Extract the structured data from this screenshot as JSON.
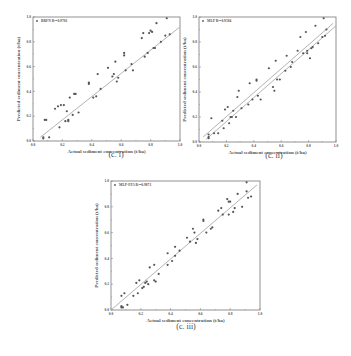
{
  "chart_data": [
    {
      "type": "scatter",
      "id": "c-i",
      "caption": "(c. i)",
      "title": "",
      "xlabel": "Actual sediment concentration (t/ha)",
      "ylabel": "Predicted sediment concentration (t/ha)",
      "xlim": [
        0.0,
        1.0
      ],
      "ylim": [
        0.0,
        1.0
      ],
      "xticks": [
        "0.0",
        "0.2",
        "0.4",
        "0.6",
        "0.8",
        "1.0"
      ],
      "yticks": [
        "0.0",
        "0.2",
        "0.4",
        "0.6",
        "0.8",
        "1.0"
      ],
      "legend": {
        "label": "BRFN",
        "r2": "R²=0.9701",
        "position": "top-left"
      },
      "fit_lines": [
        [
          0.05,
          0.03,
          1.0,
          0.92
        ]
      ],
      "frame": {
        "left": 33,
        "top": 17,
        "right": 180,
        "bottom": 141
      },
      "points": [
        [
          0.07,
          0.02
        ],
        [
          0.07,
          0.03
        ],
        [
          0.08,
          0.17
        ],
        [
          0.09,
          0.17
        ],
        [
          0.11,
          0.03
        ],
        [
          0.15,
          0.26
        ],
        [
          0.17,
          0.28
        ],
        [
          0.18,
          0.11
        ],
        [
          0.19,
          0.29
        ],
        [
          0.21,
          0.29
        ],
        [
          0.22,
          0.16
        ],
        [
          0.23,
          0.24
        ],
        [
          0.24,
          0.16
        ],
        [
          0.24,
          0.17
        ],
        [
          0.25,
          0.35
        ],
        [
          0.27,
          0.21
        ],
        [
          0.28,
          0.38
        ],
        [
          0.29,
          0.38
        ],
        [
          0.31,
          0.23
        ],
        [
          0.38,
          0.47
        ],
        [
          0.38,
          0.46
        ],
        [
          0.41,
          0.35
        ],
        [
          0.43,
          0.36
        ],
        [
          0.44,
          0.54
        ],
        [
          0.46,
          0.42
        ],
        [
          0.51,
          0.59
        ],
        [
          0.54,
          0.52
        ],
        [
          0.55,
          0.54
        ],
        [
          0.56,
          0.64
        ],
        [
          0.57,
          0.48
        ],
        [
          0.58,
          0.51
        ],
        [
          0.62,
          0.69
        ],
        [
          0.62,
          0.71
        ],
        [
          0.63,
          0.57
        ],
        [
          0.67,
          0.62
        ],
        [
          0.68,
          0.57
        ],
        [
          0.74,
          0.83
        ],
        [
          0.75,
          0.87
        ],
        [
          0.76,
          0.68
        ],
        [
          0.78,
          0.71
        ],
        [
          0.79,
          0.87
        ],
        [
          0.8,
          0.89
        ],
        [
          0.81,
          0.88
        ],
        [
          0.82,
          0.75
        ],
        [
          0.83,
          0.75
        ],
        [
          0.84,
          0.95
        ],
        [
          0.87,
          0.8
        ],
        [
          0.9,
          0.85
        ],
        [
          0.91,
          0.99
        ],
        [
          0.93,
          0.86
        ]
      ]
    },
    {
      "type": "scatter",
      "id": "c-ii",
      "caption": "(c. ii)",
      "title": "",
      "xlabel": "Actual sediment concentration (t/ha)",
      "ylabel": "Predicted sediment concentration (t/ha)",
      "xlim": [
        0.0,
        1.0
      ],
      "ylim": [
        0.0,
        1.0
      ],
      "xticks": [
        "0.0",
        "0.2",
        "0.4",
        "0.6",
        "0.8",
        "1.0"
      ],
      "yticks": [
        "0.0",
        "0.2",
        "0.4",
        "0.6",
        "0.8",
        "1.0"
      ],
      "legend": {
        "label": "MLP",
        "r2": "R²=0.9584",
        "position": "top-left"
      },
      "fit_lines": [
        [
          0.03,
          0.04,
          0.98,
          0.95
        ],
        [
          0.05,
          0.02,
          1.0,
          0.93
        ]
      ],
      "frame": {
        "left": 199,
        "top": 17,
        "right": 336,
        "bottom": 142
      },
      "points": [
        [
          0.07,
          0.03
        ],
        [
          0.07,
          0.04
        ],
        [
          0.07,
          0.06
        ],
        [
          0.09,
          0.19
        ],
        [
          0.11,
          0.07
        ],
        [
          0.14,
          0.07
        ],
        [
          0.17,
          0.17
        ],
        [
          0.18,
          0.11
        ],
        [
          0.19,
          0.26
        ],
        [
          0.21,
          0.28
        ],
        [
          0.22,
          0.15
        ],
        [
          0.23,
          0.2
        ],
        [
          0.24,
          0.2
        ],
        [
          0.25,
          0.25
        ],
        [
          0.27,
          0.2
        ],
        [
          0.28,
          0.36
        ],
        [
          0.29,
          0.41
        ],
        [
          0.31,
          0.27
        ],
        [
          0.36,
          0.3
        ],
        [
          0.37,
          0.47
        ],
        [
          0.39,
          0.34
        ],
        [
          0.42,
          0.49
        ],
        [
          0.42,
          0.5
        ],
        [
          0.43,
          0.37
        ],
        [
          0.45,
          0.34
        ],
        [
          0.51,
          0.59
        ],
        [
          0.54,
          0.44
        ],
        [
          0.55,
          0.41
        ],
        [
          0.56,
          0.65
        ],
        [
          0.57,
          0.5
        ],
        [
          0.59,
          0.5
        ],
        [
          0.63,
          0.57
        ],
        [
          0.64,
          0.69
        ],
        [
          0.67,
          0.6
        ],
        [
          0.68,
          0.64
        ],
        [
          0.72,
          0.73
        ],
        [
          0.74,
          0.84
        ],
        [
          0.76,
          0.71
        ],
        [
          0.78,
          0.88
        ],
        [
          0.79,
          0.71
        ],
        [
          0.79,
          0.73
        ],
        [
          0.81,
          0.67
        ],
        [
          0.82,
          0.75
        ],
        [
          0.83,
          0.76
        ],
        [
          0.85,
          0.93
        ],
        [
          0.87,
          0.79
        ],
        [
          0.9,
          0.84
        ],
        [
          0.91,
          0.99
        ],
        [
          0.92,
          0.85
        ],
        [
          0.93,
          0.9
        ]
      ]
    },
    {
      "type": "scatter",
      "id": "c-iii",
      "caption": "(c. iii)",
      "title": "",
      "xlabel": "Actual sediment concentration (t/ha)",
      "ylabel": "Predicted sediment concentration (t/ha)",
      "xlim": [
        0.0,
        1.0
      ],
      "ylim": [
        0.0,
        1.0
      ],
      "xticks": [
        "0.0",
        "0.2",
        "0.4",
        "0.6",
        "0.8",
        "1.0"
      ],
      "yticks": [
        "0.0",
        "0.2",
        "0.4",
        "0.6",
        "0.8",
        "1.0"
      ],
      "legend": {
        "label": "MLP-FFA",
        "r2": "R²=0.9871",
        "position": "top-left"
      },
      "fit_lines": [
        [
          0.0,
          0.0,
          0.98,
          0.97
        ]
      ],
      "frame": {
        "left": 111,
        "top": 181,
        "right": 260,
        "bottom": 310
      },
      "points": [
        [
          0.07,
          0.02
        ],
        [
          0.07,
          0.03
        ],
        [
          0.07,
          0.11
        ],
        [
          0.08,
          0.02
        ],
        [
          0.09,
          0.13
        ],
        [
          0.11,
          0.04
        ],
        [
          0.15,
          0.11
        ],
        [
          0.17,
          0.21
        ],
        [
          0.18,
          0.13
        ],
        [
          0.19,
          0.23
        ],
        [
          0.21,
          0.17
        ],
        [
          0.22,
          0.18
        ],
        [
          0.23,
          0.21
        ],
        [
          0.24,
          0.22
        ],
        [
          0.25,
          0.2
        ],
        [
          0.26,
          0.33
        ],
        [
          0.29,
          0.35
        ],
        [
          0.29,
          0.23
        ],
        [
          0.3,
          0.22
        ],
        [
          0.32,
          0.28
        ],
        [
          0.38,
          0.44
        ],
        [
          0.38,
          0.35
        ],
        [
          0.41,
          0.38
        ],
        [
          0.43,
          0.49
        ],
        [
          0.43,
          0.42
        ],
        [
          0.46,
          0.46
        ],
        [
          0.51,
          0.56
        ],
        [
          0.53,
          0.53
        ],
        [
          0.55,
          0.63
        ],
        [
          0.56,
          0.6
        ],
        [
          0.57,
          0.52
        ],
        [
          0.58,
          0.55
        ],
        [
          0.62,
          0.69
        ],
        [
          0.62,
          0.7
        ],
        [
          0.64,
          0.6
        ],
        [
          0.67,
          0.63
        ],
        [
          0.68,
          0.64
        ],
        [
          0.72,
          0.77
        ],
        [
          0.74,
          0.79
        ],
        [
          0.75,
          0.74
        ],
        [
          0.78,
          0.86
        ],
        [
          0.79,
          0.84
        ],
        [
          0.79,
          0.74
        ],
        [
          0.8,
          0.84
        ],
        [
          0.82,
          0.76
        ],
        [
          0.83,
          0.79
        ],
        [
          0.85,
          0.9
        ],
        [
          0.88,
          0.8
        ],
        [
          0.91,
          0.92
        ],
        [
          0.91,
          0.99
        ],
        [
          0.92,
          0.87
        ],
        [
          0.94,
          0.88
        ]
      ]
    }
  ]
}
